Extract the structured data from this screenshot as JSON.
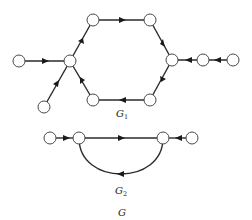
{
  "figure": {
    "graphs": [
      {
        "name": "G1",
        "label": "G",
        "label_sub": "1",
        "nodes": [
          {
            "id": "a",
            "x": 19,
            "y": 61
          },
          {
            "id": "hub_left",
            "x": 70,
            "y": 61
          },
          {
            "id": "top_left",
            "x": 93,
            "y": 20
          },
          {
            "id": "top_right",
            "x": 150,
            "y": 20
          },
          {
            "id": "hub_right",
            "x": 172,
            "y": 60
          },
          {
            "id": "bottom_right",
            "x": 150,
            "y": 100
          },
          {
            "id": "bottom_left",
            "x": 93,
            "y": 100
          },
          {
            "id": "b",
            "x": 44,
            "y": 107
          },
          {
            "id": "c",
            "x": 203,
            "y": 60
          },
          {
            "id": "d",
            "x": 233,
            "y": 60
          }
        ],
        "edges": [
          {
            "from": "a",
            "to": "hub_left"
          },
          {
            "from": "b",
            "to": "hub_left"
          },
          {
            "from": "hub_left",
            "to": "top_left"
          },
          {
            "from": "top_left",
            "to": "top_right"
          },
          {
            "from": "top_right",
            "to": "hub_right"
          },
          {
            "from": "hub_right",
            "to": "bottom_right"
          },
          {
            "from": "bottom_right",
            "to": "bottom_left"
          },
          {
            "from": "bottom_left",
            "to": "hub_left"
          },
          {
            "from": "c",
            "to": "hub_right"
          },
          {
            "from": "d",
            "to": "c"
          }
        ]
      },
      {
        "name": "G2",
        "label": "G",
        "label_sub": "2",
        "nodes": [
          {
            "id": "e",
            "x": 50,
            "y": 138
          },
          {
            "id": "f",
            "x": 79,
            "y": 138
          },
          {
            "id": "g",
            "x": 163,
            "y": 138
          },
          {
            "id": "h",
            "x": 192,
            "y": 138
          }
        ],
        "edges": [
          {
            "from": "e",
            "to": "f"
          },
          {
            "from": "f",
            "to": "g"
          },
          {
            "from": "g",
            "to": "f",
            "curved": true
          },
          {
            "from": "h",
            "to": "g"
          }
        ]
      }
    ],
    "caption": "G"
  }
}
